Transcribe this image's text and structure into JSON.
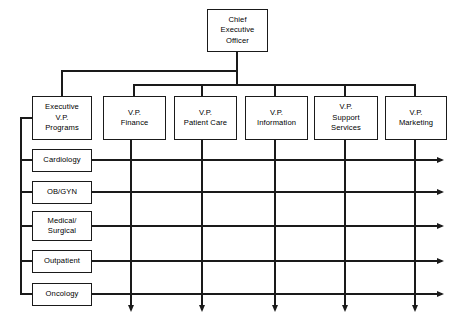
{
  "chart": {
    "type": "org-chart",
    "background_color": "#ffffff",
    "line_color": "#1a1a1a",
    "box_fill": "#ffffff"
  },
  "top": {
    "ceo": {
      "label": "Chief\nExecutive\nOfficer",
      "x": 207,
      "y": 9,
      "w": 61,
      "h": 43
    }
  },
  "vp_row": {
    "items": [
      {
        "label": "Executive\nV.P.\nPrograms",
        "x": 32,
        "y": 96,
        "w": 60,
        "h": 44,
        "center": 62
      },
      {
        "label": "V.P.\nFinance",
        "x": 103,
        "y": 96,
        "w": 63,
        "h": 44,
        "center": 134
      },
      {
        "label": "V.P.\nPatient Care",
        "x": 174,
        "y": 96,
        "w": 63,
        "h": 44,
        "center": 202
      },
      {
        "label": "V.P.\nInformation",
        "x": 245,
        "y": 96,
        "w": 63,
        "h": 44,
        "center": 275
      },
      {
        "label": "V.P.\nSupport\nServices",
        "x": 314,
        "y": 96,
        "w": 64,
        "h": 44,
        "center": 345
      },
      {
        "label": "V.P.\nMarketing",
        "x": 385,
        "y": 96,
        "w": 62,
        "h": 44,
        "center": 415
      }
    ]
  },
  "program_rows": {
    "items": [
      {
        "label": "Cardiology",
        "x": 32,
        "y": 149,
        "w": 60,
        "h": 23,
        "line_y": 160
      },
      {
        "label": "OB/GYN",
        "x": 32,
        "y": 181,
        "w": 60,
        "h": 23,
        "line_y": 192
      },
      {
        "label": "Medical/\nSurgical",
        "x": 32,
        "y": 211,
        "w": 60,
        "h": 30,
        "line_y": 226
      },
      {
        "label": "Outpatient",
        "x": 32,
        "y": 250,
        "w": 60,
        "h": 23,
        "line_y": 261
      },
      {
        "label": "Oncology",
        "x": 32,
        "y": 283,
        "w": 60,
        "h": 23,
        "line_y": 294
      }
    ]
  },
  "connectors": {
    "ceo_stem_x": 237,
    "upper_bus_y": 71,
    "upper_bus_left": 62,
    "lower_bus_y": 85,
    "lower_bus_left": 134,
    "lower_bus_right": 415,
    "left_rail_x": 21,
    "left_rail_top": 118,
    "left_rail_bottom": 294,
    "row_arrow_end_x": 442,
    "column_arrow_end_y": 307,
    "column_lines_x": [
      131,
      202,
      275,
      345,
      415
    ]
  }
}
